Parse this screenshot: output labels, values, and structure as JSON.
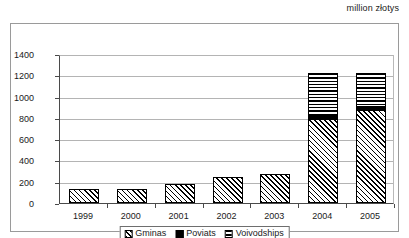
{
  "units_caption": "million złotys",
  "legend": {
    "position": "bottom-center",
    "entries": [
      {
        "label": "Gminas",
        "pattern": "diagonal-hatch"
      },
      {
        "label": "Poviats",
        "pattern": "solid-black"
      },
      {
        "label": "Voivodships",
        "pattern": "horizontal-lines"
      }
    ]
  },
  "chart_data": {
    "type": "bar",
    "subtype": "stacked",
    "title": "",
    "subtitle": "",
    "annotations": [
      "million złotys"
    ],
    "xlabel": "",
    "ylabel": "",
    "ylim": [
      0,
      1400
    ],
    "ytick_step": 200,
    "yticks": [
      0,
      200,
      400,
      600,
      800,
      1000,
      1200,
      1400
    ],
    "ytick_labels": [
      "0",
      "200",
      "400",
      "600",
      "800",
      "1000",
      "1200",
      "1400"
    ],
    "grid": true,
    "grid_axis": "y",
    "legend_position": "bottom-center",
    "categories": [
      "1999",
      "2000",
      "2001",
      "2002",
      "2003",
      "2004",
      "2005"
    ],
    "series": [
      {
        "name": "Gminas",
        "values": [
          135,
          128,
          180,
          240,
          270,
          790,
          875
        ]
      },
      {
        "name": "Poviats",
        "values": [
          0,
          0,
          0,
          0,
          0,
          40,
          30
        ]
      },
      {
        "name": "Voivodships",
        "values": [
          0,
          0,
          0,
          0,
          0,
          390,
          315
        ]
      }
    ],
    "totals": [
      135,
      128,
      180,
      240,
      270,
      1220,
      1220
    ]
  }
}
